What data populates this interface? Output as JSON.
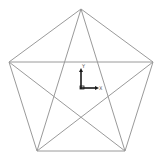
{
  "canvas": {
    "width": 163,
    "height": 161,
    "background": "#ffffff"
  },
  "figure": {
    "shape": "pentagram-in-pentagon",
    "edge_color": "#9a9a9a",
    "vertices": [
      {
        "name": "top",
        "x": 81,
        "y": 9
      },
      {
        "name": "right",
        "x": 153,
        "y": 62
      },
      {
        "name": "bottom-right",
        "x": 125,
        "y": 151
      },
      {
        "name": "bottom-left",
        "x": 37,
        "y": 151
      },
      {
        "name": "left",
        "x": 9,
        "y": 62
      }
    ]
  },
  "axis_triad": {
    "origin": {
      "x": 81,
      "y": 88
    },
    "color": "#1a1a1a",
    "x_label": "X",
    "y_label": "Y"
  }
}
